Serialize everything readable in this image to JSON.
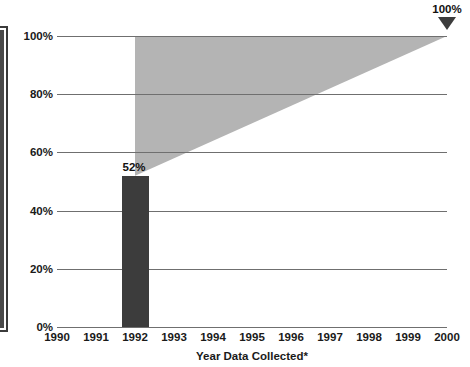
{
  "chart_data": {
    "type": "bar",
    "title": "",
    "xlabel": "Year Data Collected*",
    "ylabel": "",
    "categories": [
      "1990",
      "1991",
      "1992",
      "1993",
      "1994",
      "1995",
      "1996",
      "1997",
      "1998",
      "1999",
      "2000"
    ],
    "values": [
      null,
      null,
      52,
      null,
      null,
      null,
      null,
      null,
      null,
      null,
      null
    ],
    "ylim": [
      0,
      100
    ],
    "xlim": [
      "1990",
      "2000"
    ],
    "grid": true,
    "legend": false,
    "y_ticks": [
      {
        "value": 100,
        "label": "100%"
      },
      {
        "value": 80,
        "label": "80%"
      },
      {
        "value": 60,
        "label": "60%"
      },
      {
        "value": 40,
        "label": "40%"
      },
      {
        "value": 20,
        "label": "20%"
      },
      {
        "value": 0,
        "label": "0%"
      }
    ],
    "bars": [
      {
        "category": "1992",
        "value": 52,
        "data_label": "52%",
        "color": "#3c3c3c"
      }
    ],
    "annotations": [
      {
        "name": "target-marker",
        "category": "2000",
        "value": 100,
        "label": "100%",
        "marker": "down-triangle",
        "color": "#3c3c3c"
      }
    ],
    "bands": [
      {
        "name": "projection-wedge",
        "color": "#b4b4b4",
        "from_category": "1992",
        "to_category": "2000",
        "upper_from": 100,
        "upper_to": 100,
        "lower_from": 52,
        "lower_to": 100
      }
    ],
    "colors": {
      "bar": "#3c3c3c",
      "wedge": "#b4b4b4",
      "gridline": "#6f6f6f",
      "text": "#1a1a1a",
      "background": "#ffffff"
    }
  },
  "clipped_title": {
    "text": ""
  }
}
